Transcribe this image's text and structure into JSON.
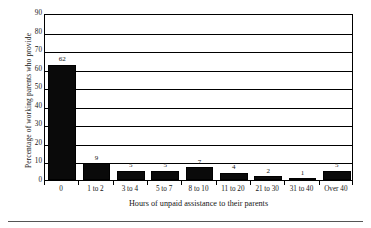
{
  "chart_data": {
    "type": "bar",
    "title": "",
    "xlabel": "Hours of unpaid assistance to their parents",
    "ylabel": "Percentage of working parents who provide",
    "categories": [
      "0",
      "1 to 2",
      "3 to 4",
      "5 to 7",
      "8 to 10",
      "11 to 20",
      "21 to 30",
      "31 to 40",
      "Over 40"
    ],
    "values": [
      62,
      9,
      5,
      5,
      7,
      4,
      2,
      1,
      5
    ],
    "data_labels": [
      "62",
      "9",
      "5",
      "5",
      "7",
      "4",
      "2",
      "1",
      "5"
    ],
    "ylim": [
      0,
      90
    ],
    "ytick_step": 10,
    "ytick_labels": [
      "0",
      "10",
      "20",
      "30",
      "40",
      "50",
      "60",
      "70",
      "80",
      "90"
    ],
    "grid": "horizontal",
    "legend": "none",
    "bar_color": "#0a0a0a",
    "axis_color": "#000000",
    "background_color": "#ffffff"
  }
}
